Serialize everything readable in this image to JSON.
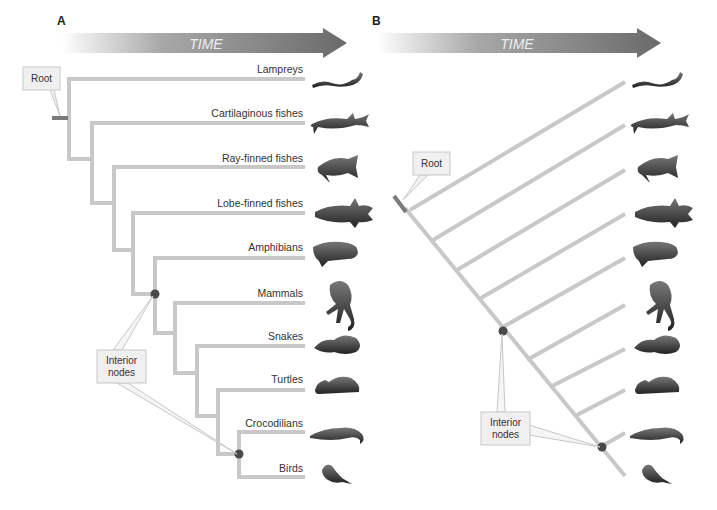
{
  "panel_a": {
    "label": "A",
    "time_label": "TIME",
    "root_label": "Root",
    "interior_label_line1": "Interior",
    "interior_label_line2": "nodes",
    "taxa": [
      "Lampreys",
      "Cartilaginous fishes",
      "Ray-finned fishes",
      "Lobe-finned fishes",
      "Amphibians",
      "Mammals",
      "Snakes",
      "Turtles",
      "Crocodilians",
      "Birds"
    ]
  },
  "panel_b": {
    "label": "B",
    "time_label": "TIME",
    "root_label": "Root",
    "interior_label_line1": "Interior",
    "interior_label_line2": "nodes"
  },
  "animals": [
    "lamprey-icon",
    "shark-icon",
    "ray-finned-fish-icon",
    "coelacanth-icon",
    "salamander-icon",
    "monkey-icon",
    "snake-icon",
    "turtle-icon",
    "crocodile-icon",
    "bird-icon"
  ],
  "colors": {
    "branch": "#c8c8c8",
    "root_branch": "#7a7a7a",
    "node": "#4a4a4a",
    "arrow_dark": "#6e6e6e",
    "callout_fill": "#f0f0f0",
    "callout_stroke": "#c8c8c8"
  }
}
